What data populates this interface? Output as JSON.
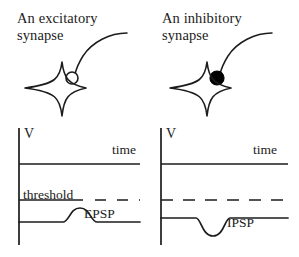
{
  "figure": {
    "background_color": "#ffffff",
    "ink_color": "#1c1c1c",
    "panels": [
      {
        "id": "excitatory",
        "title": "An excitatory\nsynapse",
        "terminal_style": "open-circle",
        "terminal_fill": "#ffffff",
        "graph": {
          "v_axis_label": "V",
          "time_axis_label": "time",
          "threshold_label": "threshold",
          "response_label": "EPSP",
          "response_direction": "depolarizing-upward"
        }
      },
      {
        "id": "inhibitory",
        "title": "An inhibitory\nsynapse",
        "terminal_style": "filled-circle",
        "terminal_fill": "#000000",
        "graph": {
          "v_axis_label": "V",
          "time_axis_label": "time",
          "threshold_label": "",
          "response_label": "IPSP",
          "response_direction": "hyperpolarizing-downward"
        }
      }
    ]
  }
}
